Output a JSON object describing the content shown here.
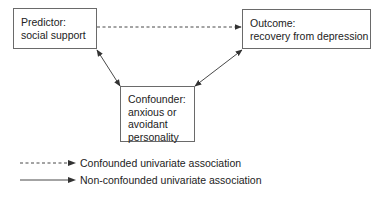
{
  "diagram": {
    "type": "causal-confounding-diagram",
    "nodes": {
      "predictor": {
        "title": "Predictor:",
        "lines": [
          "social support"
        ]
      },
      "outcome": {
        "title": "Outcome:",
        "lines": [
          "recovery from depression"
        ]
      },
      "confounder": {
        "title": "Confounder:",
        "lines": [
          "anxious or",
          "avoidant",
          "personality"
        ]
      }
    },
    "edges": [
      {
        "from": "predictor",
        "to": "outcome",
        "style": "dashed",
        "direction": "forward",
        "meaning": "Confounded univariate association"
      },
      {
        "from": "predictor",
        "to": "confounder",
        "style": "solid",
        "direction": "both",
        "meaning": "Non-confounded univariate association"
      },
      {
        "from": "confounder",
        "to": "outcome",
        "style": "solid",
        "direction": "both",
        "meaning": "Non-confounded univariate association"
      }
    ],
    "colors": {
      "line": "#333333",
      "box_border": "#6a6a6a",
      "text": "#222222",
      "background": "#ffffff"
    }
  },
  "legend": {
    "items": [
      {
        "style": "dashed",
        "label": "Confounded univariate association"
      },
      {
        "style": "solid",
        "label": "Non-confounded univariate association"
      }
    ]
  }
}
